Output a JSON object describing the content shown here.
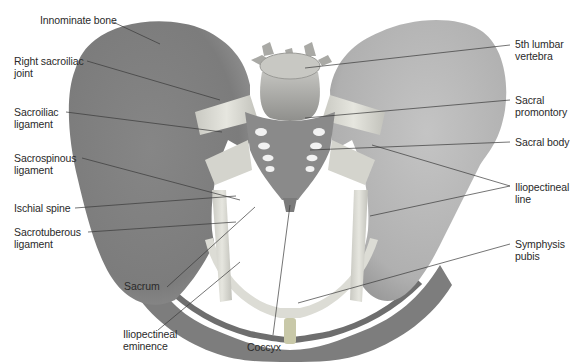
{
  "figure": {
    "colors": {
      "bone_dark": "#7a7a7a",
      "bone_mid": "#8e8e8e",
      "bone_light": "#bdbdbd",
      "ligament": "#d9d9d2",
      "vertebra": "#b4b4b0",
      "leader_line": "#3a3a3a",
      "label_text": "#2a2a2a",
      "background": "#ffffff"
    }
  },
  "labels_left": [
    {
      "id": "innominate-bone",
      "text": "Innominate bone"
    },
    {
      "id": "right-sacroiliac-joint",
      "text": "Right sacroiliac\njoint"
    },
    {
      "id": "sacroiliac-ligament",
      "text": "Sacroiliac\nligament"
    },
    {
      "id": "sacrospinous-ligament",
      "text": "Sacrospinous\nligament"
    },
    {
      "id": "ischial-spine",
      "text": "Ischial spine"
    },
    {
      "id": "sacrotuberous-ligament",
      "text": "Sacrotuberous\nligament"
    }
  ],
  "labels_bottom": [
    {
      "id": "sacrum",
      "text": "Sacrum"
    },
    {
      "id": "iliopectineal-eminence",
      "text": "Iliopectineal\neminence"
    },
    {
      "id": "coccyx",
      "text": "Coccyx"
    }
  ],
  "labels_right": [
    {
      "id": "fifth-lumbar-vertebra",
      "text": "5th lumbar\nvertebra"
    },
    {
      "id": "sacral-promontory",
      "text": "Sacral\npromontory"
    },
    {
      "id": "sacral-body",
      "text": "Sacral body"
    },
    {
      "id": "iliopectineal-line",
      "text": "Iliopectineal\nline"
    },
    {
      "id": "symphysis-pubis",
      "text": "Symphysis\npubis"
    }
  ]
}
